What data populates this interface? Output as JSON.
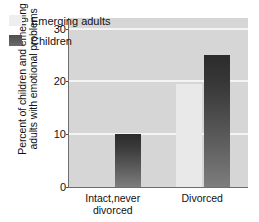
{
  "chart_data": {
    "type": "bar",
    "title": "",
    "xlabel": "",
    "ylabel_line1": "Percent of children and emerging",
    "ylabel_line2": "adults with emotional problems",
    "ylabel": "Percent of children and emerging adults with emotional problems",
    "categories": [
      "Intact,never divorced",
      "Divorced"
    ],
    "category_lines": [
      [
        "Intact,never",
        "divorced"
      ],
      [
        "Divorced"
      ]
    ],
    "series": [
      {
        "name": "Emerging adults",
        "values": [
          0,
          19.5
        ],
        "color": "#e9e9e9"
      },
      {
        "name": "Children",
        "values": [
          10,
          25
        ],
        "color": "#3f3f3f"
      }
    ],
    "ylim": [
      0,
      32
    ],
    "yticks": [
      0,
      10,
      20,
      30
    ],
    "ytick_labels": [
      "0",
      "10",
      "20",
      "30"
    ],
    "gridlines": [
      10,
      20,
      30
    ],
    "grid": true,
    "grid_color": "#f4f4f4",
    "legend_position": "top-left",
    "plot_background": "#d6d6d6",
    "axis_color": "#6e6e6e",
    "page_background": "#ffffff"
  }
}
